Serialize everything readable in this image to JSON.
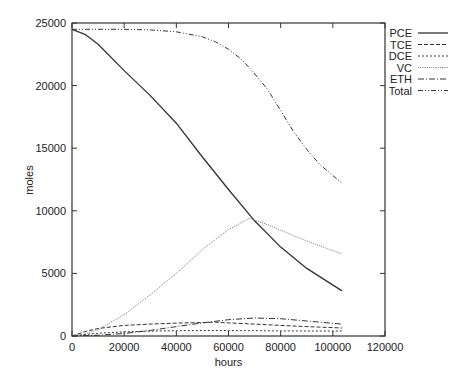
{
  "chart_data": {
    "type": "line",
    "title": "",
    "xlabel": "hours",
    "ylabel": "moles",
    "xlim": [
      0,
      120000
    ],
    "ylim": [
      0,
      25000
    ],
    "xticks": [
      0,
      20000,
      40000,
      60000,
      80000,
      100000,
      120000
    ],
    "yticks": [
      0,
      5000,
      10000,
      15000,
      20000,
      25000
    ],
    "grid": false,
    "legend_position": "right-outside-top",
    "series": [
      {
        "name": "PCE",
        "style": "solid",
        "color": "#333333",
        "x": [
          0,
          5000,
          10000,
          20000,
          30000,
          40000,
          50000,
          60000,
          70000,
          80000,
          90000,
          103500
        ],
        "y": [
          24500,
          24100,
          23300,
          21200,
          19200,
          17000,
          14300,
          11700,
          9200,
          7100,
          5400,
          3600
        ]
      },
      {
        "name": "TCE",
        "style": "dashed",
        "color": "#333333",
        "x": [
          0,
          5000,
          10000,
          20000,
          30000,
          40000,
          50000,
          55000,
          60000,
          70000,
          80000,
          90000,
          103500
        ],
        "y": [
          0,
          350,
          600,
          850,
          950,
          1030,
          1080,
          1100,
          1050,
          950,
          850,
          750,
          640
        ]
      },
      {
        "name": "DCE",
        "style": "dotted",
        "color": "#333333",
        "x": [
          0,
          5000,
          10000,
          20000,
          30000,
          40000,
          50000,
          60000,
          70000,
          80000,
          90000,
          103500
        ],
        "y": [
          0,
          120,
          220,
          330,
          390,
          420,
          430,
          430,
          420,
          410,
          400,
          400
        ]
      },
      {
        "name": "VC",
        "style": "fine-dotted",
        "color": "#777777",
        "x": [
          0,
          5000,
          10000,
          20000,
          30000,
          40000,
          50000,
          60000,
          68000,
          75000,
          85000,
          95000,
          103500
        ],
        "y": [
          0,
          150,
          500,
          1700,
          3300,
          5000,
          6900,
          8500,
          9400,
          8900,
          8000,
          7200,
          6550
        ]
      },
      {
        "name": "ETH",
        "style": "dash-dot",
        "color": "#333333",
        "x": [
          0,
          10000,
          20000,
          30000,
          40000,
          50000,
          60000,
          70000,
          80000,
          90000,
          103500
        ],
        "y": [
          0,
          60,
          200,
          450,
          750,
          1050,
          1300,
          1440,
          1380,
          1200,
          950
        ]
      },
      {
        "name": "Total",
        "style": "dash-dot-dot",
        "color": "#333333",
        "x": [
          0,
          10000,
          20000,
          30000,
          40000,
          50000,
          55000,
          60000,
          65000,
          69000,
          75000,
          80000,
          85000,
          90000,
          95000,
          103500
        ],
        "y": [
          24500,
          24500,
          24500,
          24450,
          24300,
          23900,
          23500,
          22900,
          22100,
          21200,
          19700,
          18000,
          16300,
          14900,
          13700,
          12200
        ]
      }
    ]
  },
  "legend": {
    "items": [
      {
        "label": "PCE"
      },
      {
        "label": "TCE"
      },
      {
        "label": "DCE"
      },
      {
        "label": "VC"
      },
      {
        "label": "ETH"
      },
      {
        "label": "Total"
      }
    ]
  },
  "axes": {
    "xlabel": "hours",
    "ylabel": "moles"
  }
}
